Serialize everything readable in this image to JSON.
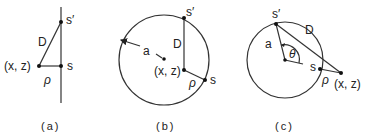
{
  "panels": {
    "a": {
      "caption": "(a)",
      "labels": {
        "s_prime": "s′",
        "D": "D",
        "xz": "(x, z)",
        "s": "s",
        "rho": "ρ"
      }
    },
    "b": {
      "caption": "(b)",
      "labels": {
        "s_prime": "s′",
        "D": "D",
        "a": "a",
        "xz": "(x, z)",
        "s": "s",
        "rho": "ρ"
      }
    },
    "c": {
      "caption": "(c)",
      "labels": {
        "s_prime": "s′",
        "D": "D",
        "a": "a",
        "theta": "θ",
        "s": "s",
        "rho": "ρ",
        "xz": "(x, z)"
      }
    }
  },
  "colors": {
    "ink": "#222222",
    "background": "#ffffff"
  }
}
